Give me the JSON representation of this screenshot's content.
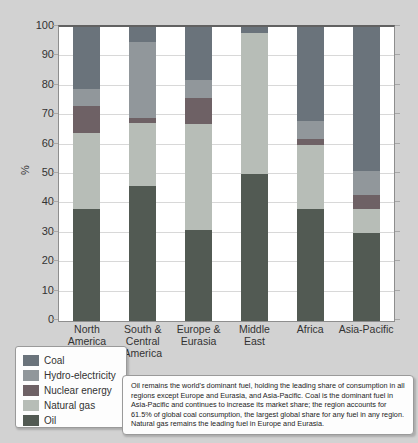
{
  "chart_data": {
    "type": "bar",
    "subtype": "stacked-percentage-bar",
    "title": "",
    "xlabel": "",
    "ylabel": "%",
    "ylim": [
      0,
      100
    ],
    "ytick_step": 10,
    "grid": "horizontal",
    "legend_position": "bottom-left",
    "categories": [
      [
        "North",
        "America"
      ],
      [
        "South &",
        "Central",
        "America"
      ],
      [
        "Europe &",
        "Eurasia"
      ],
      [
        "Middle",
        "East"
      ],
      [
        "Africa"
      ],
      [
        "Asia-Pacific"
      ]
    ],
    "series_bottom_to_top": [
      "Oil",
      "Natural gas",
      "Nuclear energy",
      "Hydro-electricity",
      "Coal"
    ],
    "values": {
      "Oil": [
        38,
        46,
        31,
        50,
        38,
        30
      ],
      "Natural gas": [
        26,
        21.5,
        36,
        48,
        22,
        8
      ],
      "Nuclear energy": [
        9,
        1.5,
        9,
        0,
        2,
        5
      ],
      "Hydro-electricity": [
        6,
        26,
        6,
        0,
        6,
        8
      ],
      "Coal": [
        21,
        5,
        18,
        2,
        32,
        49
      ]
    },
    "colors": {
      "Coal": "#6a737b",
      "Hydro-electricity": "#91979b",
      "Nuclear energy": "#6e6165",
      "Natural gas": "#b7bdb7",
      "Oil": "#525a53"
    }
  },
  "axis": {
    "y_unit_label": "%",
    "yticks": [
      0,
      10,
      20,
      30,
      40,
      50,
      60,
      70,
      80,
      90,
      100
    ]
  },
  "legend": {
    "items": [
      "Coal",
      "Hydro-electricity",
      "Nuclear energy",
      "Natural gas",
      "Oil"
    ]
  },
  "caption": {
    "text": "Oil remains the world's dominant fuel, holding the leading share of consumption in all regions except Europe and Eurasia, and Asia-Pacific. Coal is the dominant fuel in Asia-Pacific and continues to increase its market share; the region accounts for 61.5% of global coal consumption, the largest global share for any fuel in any region. Natural gas remains the leading fuel in Europe and Eurasia."
  },
  "palette": {
    "background": "#d2d2d2",
    "plot_background": "#ffffff",
    "gridline": "#d8d8d8",
    "frame": "#8e8e8e"
  }
}
